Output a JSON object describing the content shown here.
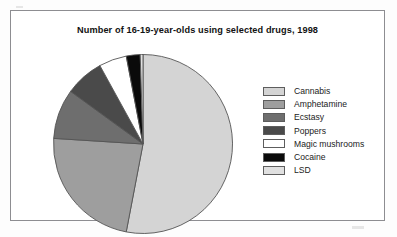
{
  "chart_data": {
    "type": "pie",
    "title": "Number of 16-19-year-olds using selected drugs, 1998",
    "xlabel": "",
    "ylabel": "",
    "legend_position": "right",
    "grid": false,
    "start_angle_deg": 0,
    "direction": "clockwise",
    "categories": [
      "Cannabis",
      "Amphetamine",
      "Ecstasy",
      "Poppers",
      "Magic mushrooms",
      "Cocaine",
      "LSD"
    ],
    "values": [
      53,
      23,
      9,
      7,
      5,
      2.5,
      0.5
    ],
    "units": "percent",
    "colors": [
      "#d4d4d4",
      "#9e9e9e",
      "#6e6e6e",
      "#4a4a4a",
      "#ffffff",
      "#0a0a0a",
      "#e0e0e0"
    ],
    "slices": [
      {
        "label": "Cannabis",
        "value": 53,
        "color": "#d4d4d4"
      },
      {
        "label": "Amphetamine",
        "value": 23,
        "color": "#9e9e9e"
      },
      {
        "label": "Ecstasy",
        "value": 9,
        "color": "#6e6e6e"
      },
      {
        "label": "Poppers",
        "value": 7,
        "color": "#4a4a4a"
      },
      {
        "label": "Magic mushrooms",
        "value": 5,
        "color": "#ffffff"
      },
      {
        "label": "Cocaine",
        "value": 2.5,
        "color": "#0a0a0a"
      },
      {
        "label": "LSD",
        "value": 0.5,
        "color": "#e0e0e0"
      }
    ]
  },
  "legend": {
    "items": [
      {
        "label": "Cannabis",
        "color": "#d4d4d4"
      },
      {
        "label": "Amphetamine",
        "color": "#9e9e9e"
      },
      {
        "label": "Ecstasy",
        "color": "#6e6e6e"
      },
      {
        "label": "Poppers",
        "color": "#4a4a4a"
      },
      {
        "label": "Magic mushrooms",
        "color": "#ffffff"
      },
      {
        "label": "Cocaine",
        "color": "#0a0a0a"
      },
      {
        "label": "LSD",
        "color": "#e0e0e0"
      }
    ]
  },
  "style": {
    "frame_color": "#8d8d91",
    "outline_color": "#555555",
    "background": "#ffffff"
  }
}
